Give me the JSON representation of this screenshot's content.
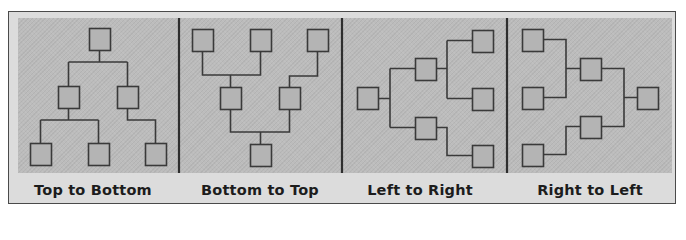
{
  "diagram": {
    "colors": {
      "frame_border": "#4a4a4a",
      "frame_bg": "#dcdcdc",
      "area_bg": "#bcbcbc",
      "line": "#3a3a3a",
      "node_fill": "#b4b4b4",
      "divider": "#2e2e2e"
    },
    "panels": [
      {
        "id": "top-to-bottom",
        "label": "Top to Bottom",
        "direction": "TB"
      },
      {
        "id": "bottom-to-top",
        "label": "Bottom to Top",
        "direction": "BT"
      },
      {
        "id": "left-to-right",
        "label": "Left to Right",
        "direction": "LR"
      },
      {
        "id": "right-to-left",
        "label": "Right to Left",
        "direction": "RL"
      }
    ],
    "node_size": 21,
    "dividers_x": [
      179,
      342,
      507
    ],
    "nodes": [
      {
        "panel": 0,
        "x": 89,
        "y": 28
      },
      {
        "panel": 0,
        "x": 58,
        "y": 86
      },
      {
        "panel": 0,
        "x": 117,
        "y": 86
      },
      {
        "panel": 0,
        "x": 30,
        "y": 143
      },
      {
        "panel": 0,
        "x": 88,
        "y": 143
      },
      {
        "panel": 0,
        "x": 145,
        "y": 143
      },
      {
        "panel": 1,
        "x": 192,
        "y": 29
      },
      {
        "panel": 1,
        "x": 250,
        "y": 29
      },
      {
        "panel": 1,
        "x": 307,
        "y": 29
      },
      {
        "panel": 1,
        "x": 220,
        "y": 87
      },
      {
        "panel": 1,
        "x": 279,
        "y": 87
      },
      {
        "panel": 1,
        "x": 250,
        "y": 144
      },
      {
        "panel": 2,
        "x": 357,
        "y": 87
      },
      {
        "panel": 2,
        "x": 415,
        "y": 58
      },
      {
        "panel": 2,
        "x": 415,
        "y": 117
      },
      {
        "panel": 2,
        "x": 472,
        "y": 30
      },
      {
        "panel": 2,
        "x": 472,
        "y": 88
      },
      {
        "panel": 2,
        "x": 472,
        "y": 145
      },
      {
        "panel": 3,
        "x": 522,
        "y": 29
      },
      {
        "panel": 3,
        "x": 522,
        "y": 87
      },
      {
        "panel": 3,
        "x": 522,
        "y": 144
      },
      {
        "panel": 3,
        "x": 580,
        "y": 58
      },
      {
        "panel": 3,
        "x": 580,
        "y": 116
      },
      {
        "panel": 3,
        "x": 637,
        "y": 87
      }
    ],
    "edges": [
      "M99.5,49 V62 M68.5,62 H127.5 M68.5,62 V86 M127.5,62 V86",
      "M68.5,107 V120 M40.5,120 H98.5 M40.5,120 V143 M98.5,120 V143",
      "M127.5,107 V120 H155.5 V143",
      "M202.5,50 V75 H260.5 V50 M230.5,75 V87",
      "M317.5,50 V76 H289.5 V87",
      "M230.5,108 V132 H289.5 V108 M260.5,132 V144",
      "M378,98.5 H390 M390,68.5 V127.5 M390,68.5 H415 M390,127.5 H415",
      "M436,68.5 H447 M447,40.5 V98.5 M447,40.5 H472 M447,98.5 H472",
      "M436,127.5 H447 V155.5 H472",
      "M543,39.5 H566 V97.5 H543 M566,68.5 H580",
      "M543,154.5 H566 V126.5 H580",
      "M601,68.5 H624 V126.5 H601 M624,97.5 H637"
    ]
  }
}
